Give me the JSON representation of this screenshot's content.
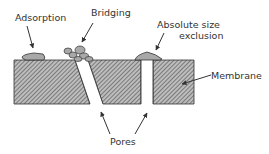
{
  "diagram": {
    "labels": {
      "adsorption": "Adsorption",
      "bridging": "Bridging",
      "absolute_size_line1": "Absolute size",
      "absolute_size_line2": "exclusion",
      "membrane": "Membrane",
      "pores": "Pores"
    },
    "colors": {
      "membrane_fill": "#9a9a9a",
      "hatch_line": "#555555",
      "particle_fill": "#a8a8a8",
      "outline": "#333333",
      "text": "#333333"
    }
  }
}
